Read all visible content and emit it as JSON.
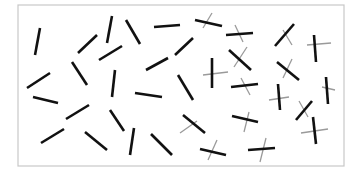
{
  "canvas": {
    "width": 361,
    "height": 177,
    "background": "#ffffff"
  },
  "frame": {
    "x": 18,
    "y": 5,
    "width": 326,
    "height": 161,
    "stroke": "#c8c8c8",
    "stroke_width": 1.2
  },
  "styles": {
    "target_color": "#111111",
    "target_width": 2.6,
    "cross_color": "#9a9a9a",
    "cross_width": 1.3
  },
  "items": [
    {
      "bar": [
        40,
        28,
        35,
        55
      ]
    },
    {
      "bar": [
        78,
        53,
        97,
        35
      ]
    },
    {
      "bar": [
        112,
        16,
        107,
        43
      ]
    },
    {
      "bar": [
        126,
        20,
        140,
        44
      ]
    },
    {
      "bar": [
        99,
        60,
        122,
        46
      ]
    },
    {
      "bar": [
        154,
        27,
        180,
        25
      ]
    },
    {
      "bar": [
        175,
        55,
        193,
        38
      ]
    },
    {
      "bar": [
        27,
        88,
        50,
        73
      ]
    },
    {
      "bar": [
        72,
        62,
        87,
        85
      ]
    },
    {
      "bar": [
        146,
        70,
        168,
        58
      ]
    },
    {
      "bar": [
        33,
        97,
        58,
        103
      ]
    },
    {
      "bar": [
        115,
        70,
        112,
        97
      ]
    },
    {
      "bar": [
        135,
        93,
        162,
        97
      ]
    },
    {
      "bar": [
        178,
        75,
        193,
        100
      ]
    },
    {
      "bar": [
        66,
        119,
        89,
        105
      ]
    },
    {
      "bar": [
        41,
        143,
        64,
        129
      ]
    },
    {
      "bar": [
        85,
        132,
        107,
        150
      ]
    },
    {
      "bar": [
        110,
        110,
        124,
        131
      ]
    },
    {
      "bar": [
        134,
        128,
        130,
        155
      ]
    },
    {
      "bar": [
        151,
        134,
        172,
        155
      ]
    },
    {
      "bar": [
        195,
        20,
        222,
        26
      ],
      "cross": [
        203,
        28,
        212,
        13
      ]
    },
    {
      "bar": [
        226,
        35,
        253,
        33
      ],
      "cross": [
        235,
        25,
        243,
        42
      ]
    },
    {
      "bar": [
        275,
        46,
        294,
        24
      ],
      "cross": [
        283,
        30,
        292,
        45
      ]
    },
    {
      "bar": [
        314,
        35,
        316,
        62
      ],
      "cross": [
        307,
        45,
        331,
        43
      ]
    },
    {
      "bar": [
        229,
        50,
        251,
        70
      ],
      "cross": [
        234,
        67,
        247,
        47
      ]
    },
    {
      "bar": [
        212,
        58,
        212,
        88
      ],
      "cross": [
        203,
        75,
        228,
        72
      ]
    },
    {
      "bar": [
        277,
        62,
        299,
        80
      ],
      "cross": [
        283,
        78,
        292,
        59
      ]
    },
    {
      "bar": [
        231,
        87,
        258,
        84
      ],
      "cross": [
        241,
        78,
        250,
        95
      ]
    },
    {
      "bar": [
        278,
        84,
        280,
        110
      ],
      "cross": [
        269,
        100,
        289,
        97
      ]
    },
    {
      "bar": [
        296,
        120,
        312,
        101
      ],
      "cross": [
        299,
        101,
        308,
        117
      ]
    },
    {
      "bar": [
        326,
        77,
        328,
        104
      ],
      "cross": [
        322,
        87,
        335,
        90
      ]
    },
    {
      "bar": [
        183,
        115,
        205,
        133
      ],
      "cross": [
        180,
        133,
        197,
        121
      ]
    },
    {
      "bar": [
        200,
        149,
        226,
        155
      ],
      "cross": [
        208,
        160,
        217,
        140
      ]
    },
    {
      "bar": [
        232,
        116,
        258,
        122
      ],
      "cross": [
        244,
        132,
        249,
        112
      ]
    },
    {
      "bar": [
        248,
        150,
        275,
        148
      ],
      "cross": [
        260,
        162,
        266,
        138
      ]
    },
    {
      "bar": [
        313,
        117,
        316,
        144
      ],
      "cross": [
        301,
        133,
        328,
        129
      ]
    }
  ]
}
